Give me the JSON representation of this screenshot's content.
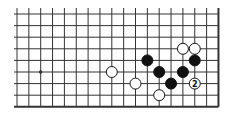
{
  "diagram": {
    "type": "go-board-fragment",
    "columns": 18,
    "rows": 9,
    "edges": {
      "right": true,
      "bottom": true,
      "top": false,
      "left": false
    },
    "star_points": [
      {
        "col": 2,
        "row": 5
      }
    ],
    "stones": [
      {
        "color": "white",
        "col": 8,
        "row": 5,
        "label": ""
      },
      {
        "color": "white",
        "col": 10,
        "row": 6,
        "label": ""
      },
      {
        "color": "white",
        "col": 12,
        "row": 7,
        "label": ""
      },
      {
        "color": "white",
        "col": 14,
        "row": 3,
        "label": ""
      },
      {
        "color": "white",
        "col": 15,
        "row": 3,
        "label": ""
      },
      {
        "color": "white",
        "col": 15,
        "row": 6,
        "label": "2"
      },
      {
        "color": "black",
        "col": 11,
        "row": 4,
        "label": ""
      },
      {
        "color": "black",
        "col": 12,
        "row": 5,
        "label": ""
      },
      {
        "color": "black",
        "col": 13,
        "row": 6,
        "label": ""
      },
      {
        "color": "black",
        "col": 14,
        "row": 5,
        "label": ""
      },
      {
        "color": "black",
        "col": 15,
        "row": 4,
        "label": ""
      }
    ],
    "colors": {
      "line": "#333333",
      "black_stone": "#111111",
      "white_stone": "#ffffff",
      "background": "#ffffff"
    }
  }
}
